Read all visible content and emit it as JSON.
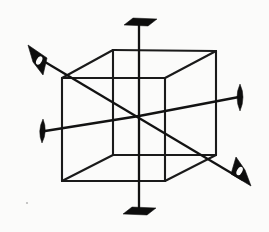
{
  "figure": {
    "caption": "",
    "background_color": "#fbfbfa",
    "ink_color": "#121212",
    "width": 269,
    "height": 232
  },
  "cube": {
    "label": "wireframe cube",
    "stroke_color": "#1a1a1a",
    "stroke_width": 2.1,
    "vertices": {
      "front_top_left": [
        113,
        50
      ],
      "front_top_right": [
        216,
        51
      ],
      "front_bottom_right": [
        216,
        155
      ],
      "front_bottom_left": [
        113,
        155
      ],
      "back_top_left": [
        62,
        78
      ],
      "back_top_right": [
        165,
        78
      ],
      "back_bottom_right": [
        165,
        181
      ],
      "back_bottom_left": [
        62,
        181
      ]
    },
    "edges": [
      "front_top_left-front_top_right",
      "front_top_right-front_bottom_right",
      "front_bottom_right-front_bottom_left",
      "front_bottom_left-front_top_left",
      "back_top_left-back_top_right",
      "back_top_right-back_bottom_right",
      "back_bottom_right-back_bottom_left",
      "back_bottom_left-back_top_left",
      "front_top_left-back_top_left",
      "front_top_right-back_top_right",
      "front_bottom_right-back_bottom_right",
      "front_bottom_left-back_bottom_left"
    ]
  },
  "center": {
    "label": "cube center",
    "point": [
      139,
      116
    ]
  },
  "axes": [
    {
      "id": "vertical-4fold-axis",
      "label": "vertical axis",
      "order": "4-fold",
      "from": [
        139,
        22
      ],
      "to": [
        139,
        212
      ],
      "arrowheads": [
        "flat-top",
        "flat-bottom"
      ]
    },
    {
      "id": "horizontal-right-axis",
      "label": "right lateral axis",
      "order": "4-fold",
      "from": [
        139,
        116
      ],
      "to": [
        240,
        97
      ],
      "arrowheads": [
        "lens-right"
      ]
    },
    {
      "id": "horizontal-left-axis",
      "label": "left lateral axis",
      "order": "4-fold",
      "from": [
        139,
        116
      ],
      "to": [
        44,
        131
      ],
      "arrowheads": [
        "lens-left"
      ]
    },
    {
      "id": "body-diagonal-axis",
      "label": "body diagonal axis",
      "order": "3-fold",
      "from": [
        32,
        55
      ],
      "to": [
        247,
        183
      ],
      "arrowheads": [
        "cone-upper-left",
        "cone-lower-right"
      ]
    }
  ],
  "arrowheads": {
    "flat_top": {
      "name": "flat-top-arrowhead",
      "shape": "foreshortened-disc",
      "center": [
        139,
        22
      ],
      "width": 32,
      "height": 8
    },
    "flat_bottom": {
      "name": "flat-bottom-arrowhead",
      "shape": "foreshortened-disc",
      "center": [
        139,
        211
      ],
      "width": 32,
      "height": 8
    },
    "lens_left": {
      "name": "left-lens-arrowhead",
      "shape": "edge-on-disc",
      "center": [
        43,
        131
      ],
      "width": 10,
      "height": 24
    },
    "lens_right": {
      "name": "right-lens-arrowhead",
      "shape": "edge-on-disc",
      "center": [
        240,
        97
      ],
      "width": 11,
      "height": 27
    },
    "cone_upper_left": {
      "name": "upper-left-cone-arrowhead",
      "shape": "cone",
      "tip": [
        28,
        47
      ],
      "base_center": [
        46,
        71
      ]
    },
    "cone_lower_right": {
      "name": "lower-right-cone-arrowhead",
      "shape": "cone",
      "tip": [
        250,
        185
      ],
      "base_center": [
        229,
        163
      ]
    }
  },
  "annotations": {
    "speck": {
      "name": "paper-speck",
      "point": [
        27,
        203
      ]
    }
  }
}
